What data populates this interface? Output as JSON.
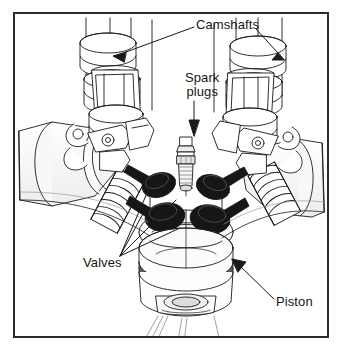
{
  "figure": {
    "kind": "technical-line-drawing",
    "background_color": "#ffffff",
    "line_color": "#1a1a1a",
    "border_color": "#2b2b2d",
    "valve_fill": "#1c1c1c",
    "shade_color": "#8e8e8e"
  },
  "labels": {
    "camshafts": "Camshafts",
    "spark_plugs_line1": "Spark",
    "spark_plugs_line2": "plugs",
    "valves": "Valves",
    "piston": "Piston"
  },
  "callouts": [
    {
      "name": "camshafts",
      "text": "Camshafts",
      "targets": 2
    },
    {
      "name": "spark-plugs",
      "text": "Spark plugs",
      "targets": 1
    },
    {
      "name": "valves",
      "text": "Valves",
      "targets": 4
    },
    {
      "name": "piston",
      "text": "Piston",
      "targets": 1
    }
  ]
}
